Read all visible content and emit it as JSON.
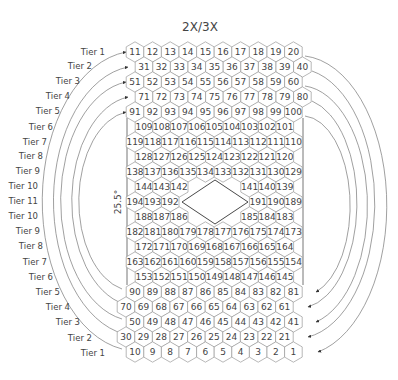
{
  "title": "2X/3X",
  "angle_label": "25.5°",
  "colors": {
    "line": "#9a9a9a",
    "text": "#444444",
    "arc": "#777777",
    "frame": "#666666"
  },
  "tier_labels_left_top": [
    "Tier 1",
    "Tier 2",
    "Tier 3",
    "Tier 4",
    "Tier 5",
    "Tier 6",
    "Tier 7",
    "Tier 8",
    "Tier 9",
    "Tier 10",
    "Tier 11"
  ],
  "tier_labels_left_bottom": [
    "Tier 10",
    "Tier 9",
    "Tier 8",
    "Tier 7",
    "Tier 6",
    "Tier 5",
    "Tier 4",
    "Tier 3",
    "Tier 2",
    "Tier 1"
  ],
  "rows": [
    {
      "y": 52,
      "x0": 135,
      "cells": [
        11,
        12,
        13,
        14,
        15,
        16,
        17,
        18,
        19,
        20
      ]
    },
    {
      "y": 67,
      "x0": 144,
      "cells": [
        31,
        32,
        33,
        34,
        35,
        36,
        37,
        38,
        39,
        40
      ]
    },
    {
      "y": 82,
      "x0": 135,
      "cells": [
        51,
        52,
        53,
        54,
        55,
        56,
        57,
        58,
        59,
        60
      ]
    },
    {
      "y": 97,
      "x0": 144,
      "cells": [
        71,
        72,
        73,
        74,
        75,
        76,
        77,
        78,
        79,
        80
      ]
    },
    {
      "y": 112,
      "x0": 135,
      "cells": [
        91,
        92,
        93,
        94,
        95,
        96,
        97,
        98,
        99,
        100
      ]
    },
    {
      "y": 127,
      "x0": 144,
      "cells": [
        109,
        108,
        107,
        106,
        105,
        104,
        103,
        102,
        101
      ]
    },
    {
      "y": 142,
      "x0": 135,
      "cells": [
        119,
        118,
        117,
        116,
        115,
        114,
        113,
        112,
        111,
        110
      ]
    },
    {
      "y": 157,
      "x0": 144,
      "cells": [
        128,
        127,
        126,
        125,
        124,
        123,
        122,
        121,
        120
      ]
    },
    {
      "y": 172,
      "x0": 135,
      "cells": [
        138,
        137,
        136,
        135,
        134,
        133,
        132,
        131,
        130,
        129
      ]
    },
    {
      "y": 187,
      "x0": 144,
      "cells": [
        144,
        143,
        142,
        null,
        null,
        null,
        141,
        140,
        139
      ]
    },
    {
      "y": 202,
      "x0": 135,
      "cells": [
        194,
        193,
        192,
        null,
        null,
        null,
        null,
        191,
        190,
        189
      ]
    },
    {
      "y": 217,
      "x0": 144,
      "cells": [
        188,
        187,
        186,
        null,
        null,
        null,
        185,
        184,
        183
      ]
    },
    {
      "y": 232,
      "x0": 135,
      "cells": [
        182,
        181,
        180,
        179,
        178,
        177,
        176,
        175,
        174,
        173
      ]
    },
    {
      "y": 247,
      "x0": 144,
      "cells": [
        172,
        171,
        170,
        169,
        168,
        167,
        166,
        165,
        164
      ]
    },
    {
      "y": 262,
      "x0": 135,
      "cells": [
        163,
        162,
        161,
        160,
        159,
        158,
        157,
        156,
        155,
        154
      ]
    },
    {
      "y": 277,
      "x0": 144,
      "cells": [
        153,
        152,
        151,
        150,
        149,
        148,
        147,
        146,
        145
      ]
    },
    {
      "y": 292,
      "x0": 135,
      "cells": [
        90,
        89,
        88,
        87,
        86,
        85,
        84,
        83,
        82,
        81
      ]
    },
    {
      "y": 307,
      "x0": 126,
      "cells": [
        70,
        69,
        68,
        67,
        66,
        65,
        64,
        63,
        62,
        61
      ]
    },
    {
      "y": 322,
      "x0": 135,
      "cells": [
        50,
        49,
        48,
        47,
        46,
        45,
        44,
        43,
        42,
        41
      ]
    },
    {
      "y": 337,
      "x0": 126,
      "cells": [
        30,
        29,
        28,
        27,
        26,
        25,
        24,
        23,
        22,
        21
      ]
    },
    {
      "y": 352,
      "x0": 135,
      "cells": [
        10,
        9,
        8,
        7,
        6,
        5,
        4,
        3,
        2,
        1
      ]
    }
  ]
}
